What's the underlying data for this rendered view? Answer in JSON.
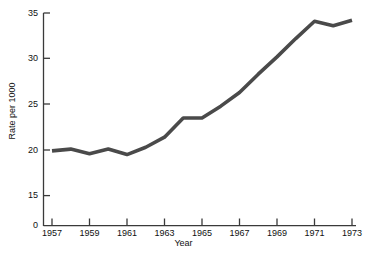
{
  "chart_data": {
    "type": "line",
    "title": "",
    "xlabel": "Year",
    "ylabel": "Rate per 1000",
    "xlim": [
      1957,
      1973
    ],
    "ylim": [
      0,
      35
    ],
    "y_axis_break": true,
    "y_break_note": "axis jumps from 0 directly to 15",
    "grid": false,
    "legend": null,
    "x": [
      1957,
      1958,
      1959,
      1960,
      1961,
      1962,
      1963,
      1964,
      1965,
      1966,
      1967,
      1968,
      1969,
      1970,
      1971,
      1972,
      1973
    ],
    "values": [
      19.9,
      20.1,
      19.6,
      20.1,
      19.5,
      20.3,
      21.4,
      23.5,
      23.5,
      24.8,
      26.3,
      28.3,
      30.2,
      32.2,
      34.1,
      33.6,
      34.2
    ],
    "series": [
      {
        "name": "Rate per 1000",
        "color": "#4a4a4a",
        "values": [
          19.9,
          20.1,
          19.6,
          20.1,
          19.5,
          20.3,
          21.4,
          23.5,
          23.5,
          24.8,
          26.3,
          28.3,
          30.2,
          32.2,
          34.1,
          33.6,
          34.2
        ]
      }
    ],
    "xticks": [
      1957,
      1959,
      1961,
      1963,
      1965,
      1967,
      1969,
      1971,
      1973
    ],
    "xtick_labels": [
      "1957",
      "1959",
      "1961",
      "1963",
      "1965",
      "1967",
      "1969",
      "1971",
      "1973"
    ],
    "yticks": [
      0,
      15,
      20,
      25,
      30,
      35
    ],
    "ytick_labels": [
      "0",
      "15",
      "20",
      "25",
      "30",
      "35"
    ]
  },
  "axes": {
    "x_title": "Year",
    "y_title": "Rate per 1000",
    "axis_color": "#3a3a3a",
    "line_color": "#4a4a4a"
  }
}
